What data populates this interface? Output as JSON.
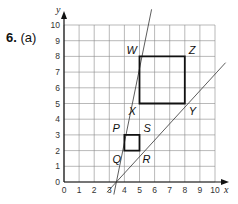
{
  "question": {
    "number": "6.",
    "part": "(a)"
  },
  "colors": {
    "grid": "#8a8a8a",
    "axis": "#111111",
    "shape": "#111111",
    "line": "#333333"
  },
  "chart_data": {
    "type": "diagram",
    "title": "",
    "xlabel": "x",
    "ylabel": "y",
    "xlim": [
      0,
      10
    ],
    "ylim": [
      0,
      10
    ],
    "grid": true,
    "x_ticks": [
      "0",
      "1",
      "2",
      "3",
      "4",
      "5",
      "6",
      "7",
      "8",
      "9",
      "10"
    ],
    "y_ticks": [
      "0",
      "1",
      "2",
      "3",
      "4",
      "5",
      "6",
      "7",
      "8",
      "9",
      "10"
    ],
    "shapes": [
      {
        "name": "PQRS",
        "vertices": {
          "P": [
            4,
            3
          ],
          "Q": [
            4,
            2
          ],
          "R": [
            5,
            2
          ],
          "S": [
            5,
            3
          ]
        }
      },
      {
        "name": "WXYZ",
        "vertices": {
          "W": [
            5,
            8
          ],
          "X": [
            5,
            5
          ],
          "Y": [
            8,
            5
          ],
          "Z": [
            8,
            8
          ]
        }
      }
    ],
    "lines": [
      {
        "name": "steep-line",
        "from": [
          3.3,
          -0.8
        ],
        "to": [
          5.8,
          11.0
        ]
      },
      {
        "name": "shallow-line",
        "from": [
          2.85,
          -0.65
        ],
        "to": [
          10.7,
          7.6
        ]
      }
    ]
  },
  "labels": {
    "x_axis": "x",
    "y_axis": "y",
    "P": "P",
    "Q": "Q",
    "R": "R",
    "S": "S",
    "W": "W",
    "X": "X",
    "Y": "Y",
    "Z": "Z"
  }
}
